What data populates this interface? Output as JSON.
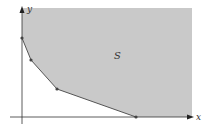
{
  "diagram": {
    "region_label": "S",
    "x_axis_label": "x",
    "y_axis_label": "y",
    "colors": {
      "region_fill": "#c9c9c9",
      "axis": "#333333",
      "boundary": "#555555",
      "vertex": "#444444"
    },
    "vertices": [
      {
        "x": 22,
        "y": 38
      },
      {
        "x": 31,
        "y": 60
      },
      {
        "x": 57,
        "y": 89
      },
      {
        "x": 136,
        "y": 117
      }
    ]
  }
}
